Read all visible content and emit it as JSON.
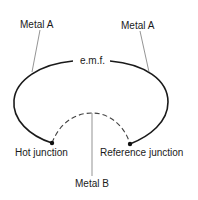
{
  "diagram": {
    "labels": {
      "metal_a_left": "Metal A",
      "metal_a_right": "Metal A",
      "emf": "e.m.f.",
      "hot_junction": "Hot junction",
      "reference_junction": "Reference junction",
      "metal_b": "Metal B"
    },
    "colors": {
      "wire_metal_a": "#1a1a1a",
      "wire_metal_b": "#444444",
      "leader": "#666666"
    }
  }
}
